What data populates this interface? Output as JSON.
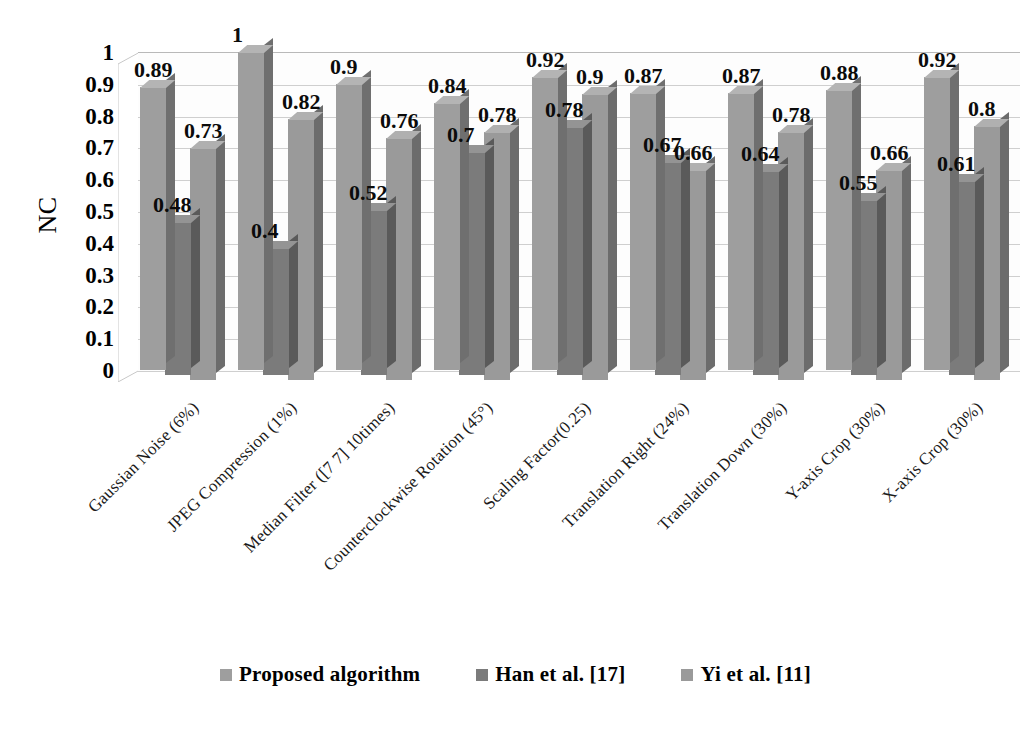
{
  "chart_data": {
    "type": "bar",
    "title": "",
    "xlabel": "",
    "ylabel": "NC",
    "ylim": [
      0,
      1
    ],
    "grid": true,
    "legend_position": "bottom",
    "categories": [
      "Gaussian Noise (6%)",
      "JPEG Compression (1%)",
      "Median Filter ([7 7] 10times)",
      "Counterclockwise Rotation (45°)",
      "Scaling Factor(0.25)",
      "Translation Right (24%)",
      "Translation Down (30%)",
      "Y-axis Crop (30%)",
      "X-axis Crop (30%)"
    ],
    "series": [
      {
        "name": "Proposed  algorithm",
        "color": "#9e9e9e",
        "values": [
          0.89,
          1,
          0.9,
          0.84,
          0.92,
          0.87,
          0.87,
          0.88,
          0.92
        ],
        "labels": [
          "0.89",
          "1",
          "0.9",
          "0.84",
          "0.92",
          "0.87",
          "0.87",
          "0.88",
          "0.92"
        ]
      },
      {
        "name": "Han et al. [17]",
        "color": "#7b7b7b",
        "values": [
          0.48,
          0.4,
          0.52,
          0.7,
          0.78,
          0.67,
          0.64,
          0.55,
          0.61
        ],
        "labels": [
          "0.48",
          "0.4",
          "0.52",
          "0.7",
          "0.78",
          "0.67",
          "0.64",
          "0.55",
          "0.61"
        ]
      },
      {
        "name": "Yi et al. [11]",
        "color": "#9a9a9a",
        "values": [
          0.73,
          0.82,
          0.76,
          0.78,
          0.9,
          0.66,
          0.78,
          0.66,
          0.8
        ],
        "labels": [
          "0.73",
          "0.82",
          "0.76",
          "0.78",
          "0.9",
          "0.66",
          "0.78",
          "0.66",
          "0.8"
        ]
      }
    ],
    "y_ticks": [
      "1",
      "0.9",
      "0.8",
      "0.7",
      "0.6",
      "0.5",
      "0.4",
      "0.3",
      "0.2",
      "0.1",
      "0"
    ],
    "y_tick_values": [
      1,
      0.9,
      0.8,
      0.7,
      0.6,
      0.5,
      0.4,
      0.3,
      0.2,
      0.1,
      0
    ]
  },
  "legend": {
    "items": [
      {
        "label": "Proposed  algorithm",
        "color": "#9e9e9e"
      },
      {
        "label": "Han et al. [17]",
        "color": "#7b7b7b"
      },
      {
        "label": "Yi et al. [11]",
        "color": "#9a9a9a"
      }
    ]
  }
}
